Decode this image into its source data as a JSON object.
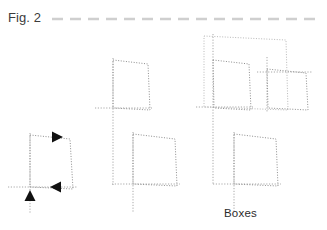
{
  "figure": {
    "label": "Fig. 2",
    "caption": "Boxes",
    "rule": {
      "color": "#cfcfcf",
      "x1": 52,
      "x2": 322,
      "y": 19,
      "dash": "11 7",
      "width": 2.6
    },
    "colors": {
      "line": "#b9b9b9",
      "line_dark": "#8e8e8e",
      "axis": "#a8a8a8",
      "arrow": "#111111",
      "label_text": "#3c3c3c",
      "caption_text": "#2b2b2b",
      "background": "#ffffff"
    },
    "stages": [
      {
        "name": "stage-1-single-box",
        "boxes": [
          {
            "name": "box-lower-left",
            "points": "30,135 70,139 73,189 30,187"
          }
        ],
        "axes": [
          {
            "name": "axis-horizontal",
            "x1": 8,
            "y1": 187,
            "x2": 78,
            "y2": 187
          },
          {
            "name": "axis-vertical",
            "x1": 30,
            "y1": 133,
            "x2": 30,
            "y2": 214
          }
        ],
        "arrows": [
          {
            "name": "arrow-right",
            "x": 52,
            "y": 137,
            "dir": "right"
          },
          {
            "name": "arrow-left",
            "x": 50,
            "y": 187,
            "dir": "left"
          },
          {
            "name": "arrow-up",
            "x": 30,
            "y": 201,
            "dir": "up"
          }
        ]
      },
      {
        "name": "stage-2-two-boxes",
        "boxes": [
          {
            "name": "box-upper-middle",
            "points": "113,60 148,64 150,110 113,108"
          },
          {
            "name": "box-lower-middle",
            "points": "133,134 175,139 177,186 133,184"
          }
        ],
        "axes": [
          {
            "name": "axis-horizontal-upper",
            "x1": 95,
            "y1": 108,
            "x2": 152,
            "y2": 108
          },
          {
            "name": "axis-horizontal-lower",
            "x1": 112,
            "y1": 184,
            "x2": 180,
            "y2": 184
          },
          {
            "name": "axis-vertical-upper",
            "x1": 113,
            "y1": 58,
            "x2": 113,
            "y2": 185
          },
          {
            "name": "axis-vertical-lower",
            "x1": 133,
            "y1": 132,
            "x2": 133,
            "y2": 212
          }
        ],
        "arrows": []
      },
      {
        "name": "stage-3-three-boxes",
        "boxes": [
          {
            "name": "box-outer-large",
            "points": "204,36 286,40 288,110 204,107"
          },
          {
            "name": "box-inner",
            "points": "213,60 249,64 251,110 214,108"
          },
          {
            "name": "box-right",
            "points": "267,69 306,73 308,110 268,108"
          },
          {
            "name": "box-bottom",
            "points": "234,134 276,139 278,186 234,184"
          }
        ],
        "axes": [
          {
            "name": "axis-horizontal-inner",
            "x1": 196,
            "y1": 107,
            "x2": 253,
            "y2": 107
          },
          {
            "name": "axis-horizontal-right",
            "x1": 257,
            "y1": 72,
            "x2": 312,
            "y2": 72
          },
          {
            "name": "axis-horizontal-bottom",
            "x1": 213,
            "y1": 184,
            "x2": 281,
            "y2": 184
          },
          {
            "name": "axis-vertical-inner",
            "x1": 213,
            "y1": 34,
            "x2": 213,
            "y2": 185
          },
          {
            "name": "axis-vertical-right",
            "x1": 267,
            "y1": 57,
            "x2": 267,
            "y2": 112
          },
          {
            "name": "axis-vertical-bottom",
            "x1": 234,
            "y1": 132,
            "x2": 234,
            "y2": 212
          }
        ],
        "arrows": []
      }
    ]
  }
}
